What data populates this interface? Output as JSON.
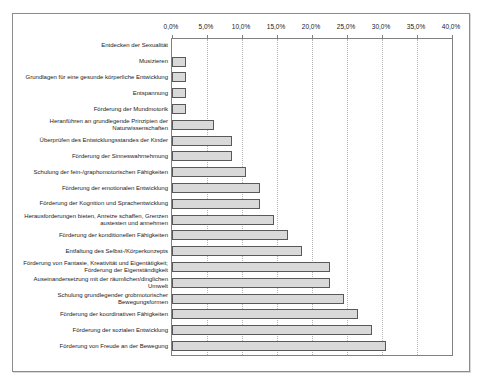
{
  "chart_data": {
    "type": "bar",
    "orientation": "horizontal",
    "title": "",
    "xlabel": "",
    "ylabel": "",
    "xlim": [
      0,
      40
    ],
    "x_ticks": [
      "0,0%",
      "5,0%",
      "10,0%",
      "15,0%",
      "20,0%",
      "25,0%",
      "30,0%",
      "35,0%",
      "40,0%"
    ],
    "grid": "vertical dotted gridlines every 5%, ticks above top axis",
    "legend": "none",
    "colors": {
      "bar_fill": "#d9d9d9",
      "bar_border": "#595959",
      "gridline": "#b3b3b3",
      "axis": "#808080",
      "frame_border": "#8c8c8c",
      "text": "#1a1a1a",
      "background": "#ffffff"
    },
    "categories": [
      "Entdecken der Sexualität",
      "Musizieren",
      "Grundlagen für eine gesunde körperliche Entwicklung",
      "Entspannung",
      "Förderung der Mundmotorik",
      "Heranführen an grundlegende Prinzipien der Naturwissenschaften",
      "Überprüfen des Entwicklungsstandes der Kinder",
      "Förderung der Sinneswahrnehmung",
      "Schulung der fein-/graphomotorischen Fähigkeiten",
      "Förderung der emotionalen Entwicklung",
      "Förderung der Kognition und Sprachentwicklung",
      "Herausforderungen bieten, Anreize schaffen, Grenzen austesten und annehmen",
      "Förderung der konditionellen Fähigkeiten",
      "Entfaltung des Selbst-/Körperkonzepts",
      "Förderung von Fantasie, Kreativität und Eigentätigkeit; Förderung der Eigenständigkeit",
      "Auseinandersetzung mit der räumlichen/dinglichen Umwelt",
      "Schulung grundlegender grobmotorischer Bewegungsformen",
      "Förderung der koordinativen Fähigkeiten",
      "Förderung der sozialen Entwicklung",
      "Förderung von Freude an der Bewegung"
    ],
    "values": [
      0,
      2,
      2,
      2,
      2,
      6,
      8.5,
      8.5,
      10.5,
      12.5,
      12.5,
      14.5,
      16.5,
      18.5,
      22.5,
      22.5,
      24.5,
      26.5,
      28.5,
      30.5
    ],
    "values_unit": "%"
  }
}
